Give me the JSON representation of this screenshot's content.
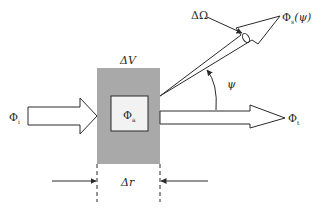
{
  "diagram": {
    "labels": {
      "volume": "ΔV",
      "incident_flux": "Φ",
      "incident_flux_sub": "i",
      "absorbed_flux": "Φ",
      "absorbed_flux_sub": "a",
      "transmitted_flux": "Φ",
      "transmitted_flux_sub": "t",
      "scattered_flux": "Φ",
      "scattered_flux_sub": "s",
      "scattered_flux_arg": "(ψ)",
      "solid_angle": "ΔΩ",
      "angle": "ψ",
      "thickness": "Δr"
    },
    "colors": {
      "volume_fill": "#a9a9a9",
      "stroke": "#2a2a2a",
      "background": "#ffffff"
    }
  }
}
